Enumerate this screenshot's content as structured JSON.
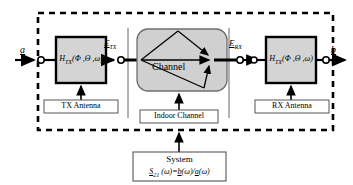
{
  "figure": {
    "type": "block-diagram",
    "system_boundary": "dashed rectangle"
  },
  "signals": {
    "input": "a",
    "output": "b",
    "tx_field": "E",
    "tx_field_sub": "TX",
    "rx_field": "E",
    "rx_field_sub": "RX"
  },
  "blocks": {
    "tx": {
      "symbol": "H",
      "subscript": "TX",
      "args": "(Φ ,Θ ,ω)",
      "caption": "TX Antenna"
    },
    "channel": {
      "label": "Channel",
      "caption": "Indoor Channel"
    },
    "rx": {
      "symbol": "H",
      "subscript": "TX",
      "args": "(Φ ,Θ ,ω)",
      "caption": "RX Antenna"
    }
  },
  "system_box": {
    "title": "System",
    "formula_s": "S",
    "formula_sub": "21",
    "formula_rest": " (ω)=",
    "formula_num": "b",
    "formula_omega1": "(ω)/",
    "formula_den": "a",
    "formula_omega2": "(ω)"
  },
  "colors": {
    "block_fill": "#d4d4d4",
    "channel_fill": "#d0d0d0",
    "stroke": "#000000",
    "caption_fill": "#ffffff"
  }
}
